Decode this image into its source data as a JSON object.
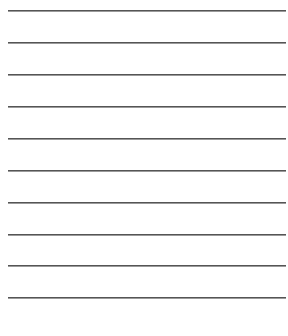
{
  "sheet": {
    "type": "ruled-lines",
    "line_count": 10,
    "line_color": "#555555",
    "background": "#ffffff",
    "lines_y": [
      10,
      42,
      74,
      106,
      138,
      170,
      202,
      234,
      265,
      297
    ]
  }
}
